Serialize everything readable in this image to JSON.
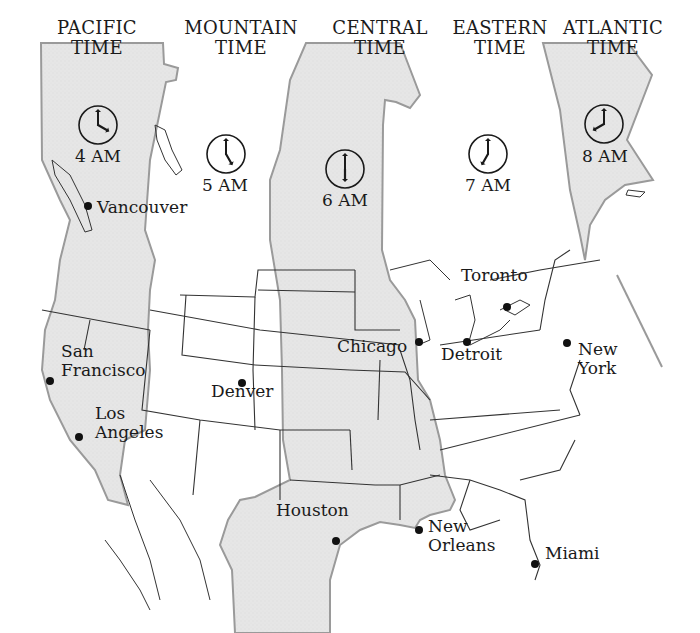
{
  "map": {
    "colors": {
      "shaded_zone": "#e4e4e4",
      "white_zone": "#ffffff",
      "zone_border": "#9a9a9a",
      "state_line": "#333333",
      "text": "#1a1a1a"
    },
    "time_zones": [
      {
        "name_line1": "PACIFIC",
        "name_line2": "TIME",
        "time": "4 AM",
        "shaded": true,
        "clock": {
          "hour": 4,
          "minute": 0
        },
        "label_x": 97,
        "label_y": 46,
        "clock_x": 98,
        "clock_y": 125,
        "time_x": 98,
        "time_y": 157
      },
      {
        "name_line1": "MOUNTAIN",
        "name_line2": "TIME",
        "time": "5 AM",
        "shaded": false,
        "clock": {
          "hour": 5,
          "minute": 0
        },
        "label_x": 241,
        "label_y": 46,
        "clock_x": 226,
        "clock_y": 154,
        "time_x": 225,
        "time_y": 186
      },
      {
        "name_line1": "CENTRAL",
        "name_line2": "TIME",
        "time": "6 AM",
        "shaded": true,
        "clock": {
          "hour": 6,
          "minute": 0
        },
        "label_x": 380,
        "label_y": 46,
        "clock_x": 345,
        "clock_y": 169,
        "time_x": 345,
        "time_y": 201
      },
      {
        "name_line1": "EASTERN",
        "name_line2": "TIME",
        "time": "7 AM",
        "shaded": false,
        "clock": {
          "hour": 7,
          "minute": 0
        },
        "label_x": 500,
        "label_y": 46,
        "clock_x": 488,
        "clock_y": 154,
        "time_x": 488,
        "time_y": 186
      },
      {
        "name_line1": "ATLANTIC",
        "name_line2": "TIME",
        "time": "8 AM",
        "shaded": true,
        "clock": {
          "hour": 8,
          "minute": 0
        },
        "label_x": 613,
        "label_y": 46,
        "clock_x": 604,
        "clock_y": 124,
        "time_x": 605,
        "time_y": 157
      }
    ],
    "cities": [
      {
        "name": "Vancouver",
        "lines": [
          "Vancouver"
        ],
        "dot_x": 88,
        "dot_y": 206,
        "label_x": 97,
        "label_y": 208
      },
      {
        "name": "San Francisco",
        "lines": [
          "San",
          "Francisco"
        ],
        "dot_x": 50,
        "dot_y": 381,
        "label_x": 61,
        "label_y": 352
      },
      {
        "name": "Los Angeles",
        "lines": [
          "Los",
          "Angeles"
        ],
        "dot_x": 79,
        "dot_y": 437,
        "label_x": 95,
        "label_y": 414
      },
      {
        "name": "Denver",
        "lines": [
          "Denver"
        ],
        "dot_x": 242,
        "dot_y": 383,
        "label_x": 211,
        "label_y": 392
      },
      {
        "name": "Chicago",
        "lines": [
          "Chicago"
        ],
        "dot_x": 419,
        "dot_y": 342,
        "label_x": 337,
        "label_y": 347
      },
      {
        "name": "Detroit",
        "lines": [
          "Detroit"
        ],
        "dot_x": 467,
        "dot_y": 342,
        "label_x": 441,
        "label_y": 355
      },
      {
        "name": "Toronto",
        "lines": [
          "Toronto"
        ],
        "dot_x": 507,
        "dot_y": 307,
        "label_x": 461,
        "label_y": 276
      },
      {
        "name": "New York",
        "lines": [
          "New",
          "York"
        ],
        "dot_x": 567,
        "dot_y": 343,
        "label_x": 578,
        "label_y": 350
      },
      {
        "name": "Houston",
        "lines": [
          "Houston"
        ],
        "dot_x": 336,
        "dot_y": 541,
        "label_x": 276,
        "label_y": 511
      },
      {
        "name": "New Orleans",
        "lines": [
          "New",
          "Orleans"
        ],
        "dot_x": 419,
        "dot_y": 530,
        "label_x": 428,
        "label_y": 527
      },
      {
        "name": "Miami",
        "lines": [
          "Miami"
        ],
        "dot_x": 535,
        "dot_y": 564,
        "label_x": 545,
        "label_y": 554
      }
    ]
  }
}
